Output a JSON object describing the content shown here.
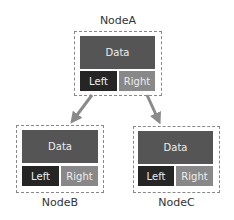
{
  "diagram": {
    "type": "binary-tree",
    "colors": {
      "data": "#555555",
      "left": "#252525",
      "right": "#888888",
      "border": "#888888",
      "arrow": "#8a8a8a"
    },
    "nodes": [
      {
        "name": "NodeA",
        "data_label": "Data",
        "left_label": "Left",
        "right_label": "Right"
      },
      {
        "name": "NodeB",
        "data_label": "Data",
        "left_label": "Left",
        "right_label": "Right"
      },
      {
        "name": "NodeC",
        "data_label": "Data",
        "left_label": "Left",
        "right_label": "Right"
      }
    ],
    "edges": [
      {
        "from": "NodeA",
        "to": "NodeB"
      },
      {
        "from": "NodeA",
        "to": "NodeC"
      }
    ]
  }
}
